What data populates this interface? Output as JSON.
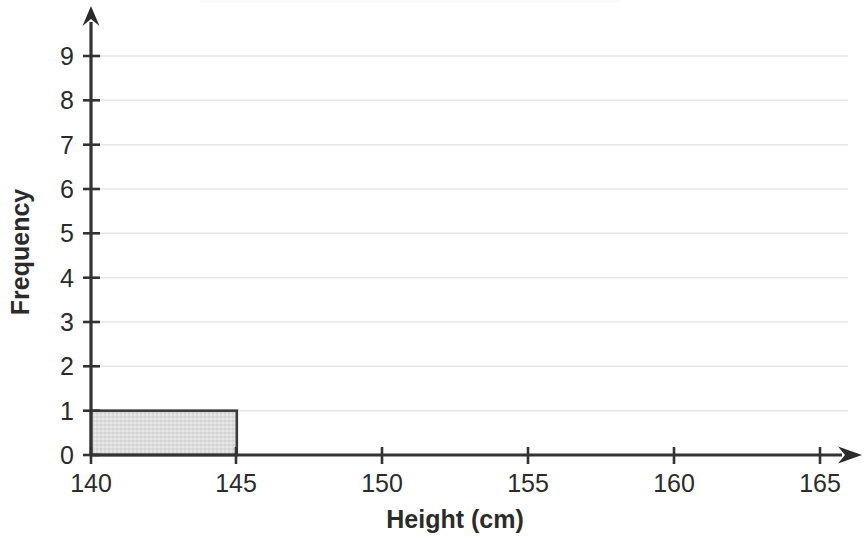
{
  "chart_data": {
    "type": "bar",
    "title": "",
    "subtitle": "",
    "xlabel": "Height (cm)",
    "ylabel": "Frequency",
    "categories": [
      "140-145",
      "145-150",
      "150-155",
      "155-160",
      "160-165"
    ],
    "values": [
      1,
      0,
      0,
      0,
      0
    ],
    "bin_edges": [
      140,
      145,
      150,
      155,
      160,
      165
    ],
    "bin_width": 5,
    "bars": [
      {
        "x_start": 140,
        "x_end": 145,
        "frequency": 1
      }
    ],
    "x_ticks": [
      140,
      145,
      150,
      155,
      160,
      165
    ],
    "y_ticks": [
      0,
      1,
      2,
      3,
      4,
      5,
      6,
      7,
      8,
      9
    ],
    "xlim": [
      140,
      165
    ],
    "ylim": [
      0,
      9
    ],
    "grid": true,
    "grid_axis": "y",
    "legend": null,
    "legend_position": "none",
    "annotations": [],
    "axis_arrows": true
  },
  "axes": {
    "y": {
      "label": "Frequency",
      "tick_labels": [
        "0",
        "1",
        "2",
        "3",
        "4",
        "5",
        "6",
        "7",
        "8",
        "9"
      ]
    },
    "x": {
      "label": "Height (cm)",
      "tick_labels": [
        "140",
        "145",
        "150",
        "155",
        "160",
        "165"
      ]
    }
  },
  "colors": {
    "background": "#ffffff",
    "bar_fill": "#dcdcdc",
    "bar_stroke": "#3a3a3a",
    "gridline": "#e6e6e6",
    "axis": "#333333",
    "text": "#2b2b2b"
  }
}
